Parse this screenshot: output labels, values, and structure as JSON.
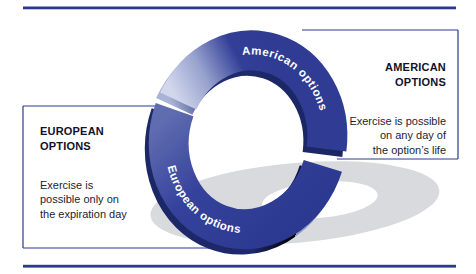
{
  "diagram": {
    "ring": {
      "american_arc_label": "American options",
      "european_arc_label": "European options"
    },
    "american_box": {
      "title": "AMERICAN\nOPTIONS",
      "body": "Exercise is possible\non any day of\nthe option’s life"
    },
    "european_box": {
      "title": "EUROPEAN\nOPTIONS",
      "body": "Exercise is\npossible only on\nthe expiration day"
    },
    "colors": {
      "navy": "#323f97",
      "navy_dark": "#1c2766",
      "arc_highlight": "#d0d6eb",
      "shadow_gray": "#d9dade",
      "rule_navy": "#2c3890",
      "label_text": "#ffffff"
    }
  }
}
